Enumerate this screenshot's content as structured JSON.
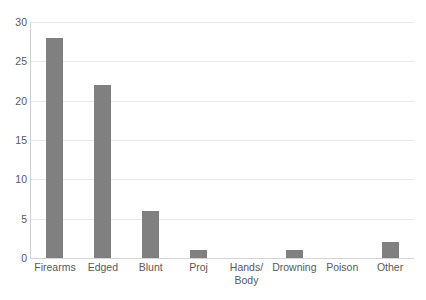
{
  "chart_data": {
    "type": "bar",
    "title": "",
    "subtitle": "",
    "xlabel": "",
    "ylabel": "",
    "categories": [
      "Firearms",
      "Edged",
      "Blunt",
      "Proj",
      "Hands/\nBody",
      "Drowning",
      "Poison",
      "Other"
    ],
    "values": [
      28,
      22,
      6,
      1,
      0,
      1,
      0,
      2
    ],
    "ylim": [
      0,
      30
    ],
    "yticks": [
      0,
      5,
      10,
      15,
      20,
      25,
      30
    ],
    "ytick_labels": [
      "0",
      "5",
      "10",
      "15",
      "20",
      "25",
      "30"
    ],
    "grid": "horizontal",
    "legend": "none",
    "bar_color": "#808080",
    "gridline_color": "#e8e8e8",
    "axis_color": "#d0d0d0",
    "tick_label_color": "#595959",
    "background": "#ffffff"
  }
}
